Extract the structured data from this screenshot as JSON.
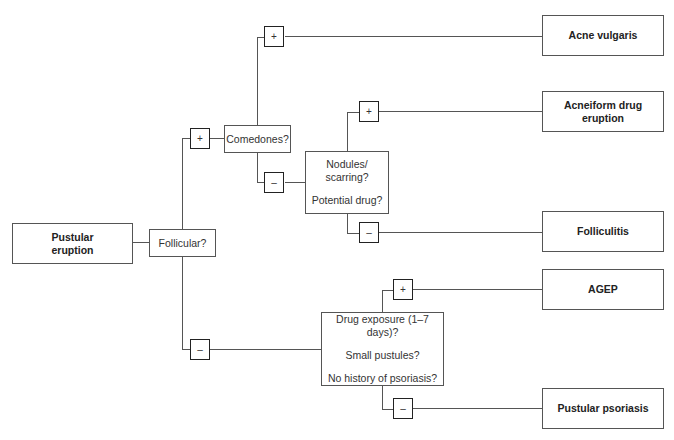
{
  "diagram": {
    "type": "decision-tree",
    "start": {
      "label_line1": "Pustular",
      "label_line2": "eruption"
    },
    "q_follicular": {
      "label": "Follicular?"
    },
    "q_comedones": {
      "label": "Comedones?"
    },
    "q_nodules": {
      "line1": "Nodules/",
      "line2": "scarring?",
      "line3": "Potential drug?"
    },
    "q_drug": {
      "line1": "Drug exposure (1–7 days)?",
      "line2": "Small pustules?",
      "line3": "No history of psoriasis?"
    },
    "signs": {
      "plus": "+",
      "minus": "–"
    },
    "outcomes": {
      "acne_vulgaris": "Acne vulgaris",
      "acneiform_line1": "Acneiform drug",
      "acneiform_line2": "eruption",
      "folliculitis": "Folliculitis",
      "agep": "AGEP",
      "pustular_psoriasis": "Pustular psoriasis"
    },
    "edges": [
      {
        "from": "Pustular eruption",
        "to": "Follicular?"
      },
      {
        "from": "Follicular?",
        "branch": "+",
        "to": "Comedones?"
      },
      {
        "from": "Follicular?",
        "branch": "-",
        "to": "Drug exposure (1-7 days)? / Small pustules? / No history of psoriasis?"
      },
      {
        "from": "Comedones?",
        "branch": "+",
        "to": "Acne vulgaris"
      },
      {
        "from": "Comedones?",
        "branch": "-",
        "to": "Nodules/scarring? Potential drug?"
      },
      {
        "from": "Nodules/scarring? Potential drug?",
        "branch": "+",
        "to": "Acneiform drug eruption"
      },
      {
        "from": "Nodules/scarring? Potential drug?",
        "branch": "-",
        "to": "Folliculitis"
      },
      {
        "from": "Drug exposure box",
        "branch": "+",
        "to": "AGEP"
      },
      {
        "from": "Drug exposure box",
        "branch": "-",
        "to": "Pustular psoriasis"
      }
    ]
  }
}
